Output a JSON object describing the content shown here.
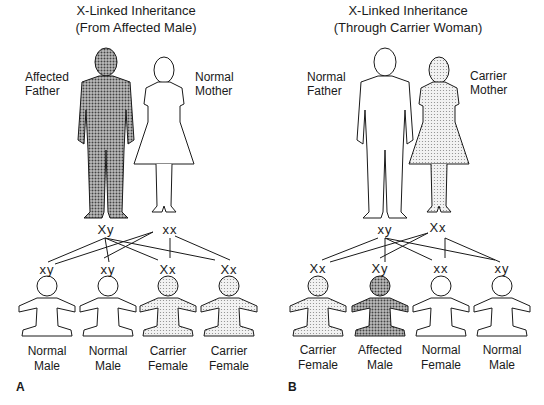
{
  "panels": [
    {
      "letter": "A",
      "title_line1": "X-Linked Inheritance",
      "title_line2": "(From Affected Male)",
      "father": {
        "label_line1": "Affected",
        "label_line2": "Father",
        "genotype": "Xy",
        "status": "affected"
      },
      "mother": {
        "label_line1": "Normal",
        "label_line2": "Mother",
        "genotype": "xx",
        "status": "normal"
      },
      "children": [
        {
          "genotype": "xy",
          "label_line1": "Normal",
          "label_line2": "Male",
          "status": "normal"
        },
        {
          "genotype": "xy",
          "label_line1": "Normal",
          "label_line2": "Male",
          "status": "normal"
        },
        {
          "genotype": "Xx",
          "label_line1": "Carrier",
          "label_line2": "Female",
          "status": "carrier"
        },
        {
          "genotype": "Xx",
          "label_line1": "Carrier",
          "label_line2": "Female",
          "status": "carrier"
        }
      ]
    },
    {
      "letter": "B",
      "title_line1": "X-Linked Inheritance",
      "title_line2": "(Through Carrier Woman)",
      "father": {
        "label_line1": "Normal",
        "label_line2": "Father",
        "genotype": "xy",
        "status": "normal"
      },
      "mother": {
        "label_line1": "Carrier",
        "label_line2": "Mother",
        "genotype": "Xx",
        "status": "carrier"
      },
      "children": [
        {
          "genotype": "Xx",
          "label_line1": "Carrier",
          "label_line2": "Female",
          "status": "carrier"
        },
        {
          "genotype": "Xy",
          "label_line1": "Affected",
          "label_line2": "Male",
          "status": "affected"
        },
        {
          "genotype": "xx",
          "label_line1": "Normal",
          "label_line2": "Female",
          "status": "normal"
        },
        {
          "genotype": "xy",
          "label_line1": "Normal",
          "label_line2": "Male",
          "status": "normal"
        }
      ]
    }
  ],
  "colors": {
    "affected": "#8a8a8a",
    "carrier": "#d6d6d6",
    "normal": "#ffffff",
    "ink": "#1a1a1a"
  }
}
